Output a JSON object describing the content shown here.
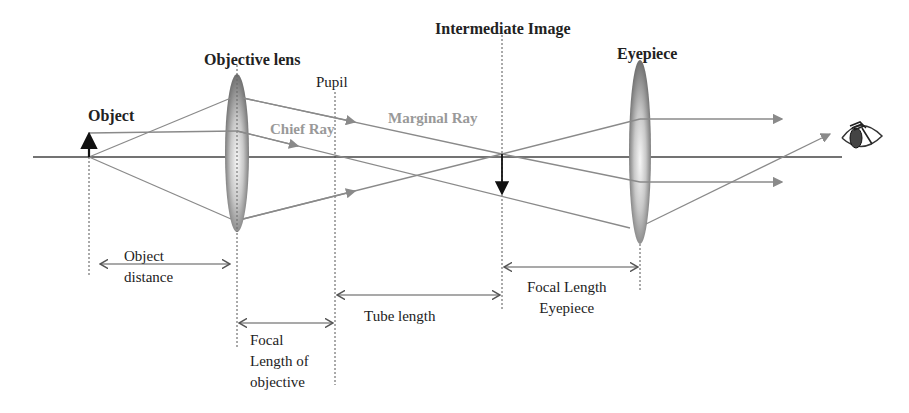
{
  "labels": {
    "object": "Object",
    "objective_lens": "Objective lens",
    "pupil": "Pupil",
    "chief_ray": "Chief Ray",
    "marginal_ray": "Marginal Ray",
    "intermediate_image": "Intermediate Image",
    "eyepiece": "Eyepiece"
  },
  "dimensions": {
    "object_distance": "Object\ndistance",
    "focal_length_objective": "Focal\nLength of\nobjective",
    "tube_length": "Tube length",
    "focal_length_eyepiece": "Focal Length\nEyepiece"
  },
  "colors": {
    "axis": "#444444",
    "ray": "#8a8a8a",
    "text": "#222222",
    "ray_label": "#999999",
    "lens_dark": "#6e6e6e",
    "lens_light": "#f2f2f2"
  }
}
